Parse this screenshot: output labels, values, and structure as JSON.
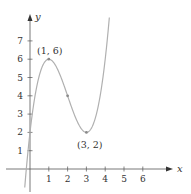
{
  "chart_data": {
    "type": "line",
    "title": "",
    "xlabel": "x",
    "ylabel": "y",
    "function": "y = x^3 - 6x^2 + 9x + 2",
    "xlim": [
      -0.8,
      7.5
    ],
    "ylim": [
      -1.3,
      8.3
    ],
    "grid": false,
    "x_ticks": [
      1,
      2,
      3,
      4,
      5,
      6
    ],
    "y_ticks": [
      1,
      2,
      3,
      4,
      5,
      6,
      7
    ],
    "curve_x_range": [
      -0.28,
      4.22
    ],
    "colors": {
      "curve": "#b0b0b0",
      "axis": "#555555",
      "text": "#333333",
      "point": "#8a8a8a"
    },
    "annotations": [
      {
        "label": "(1, 6)",
        "x": 1,
        "y": 6,
        "position": "above"
      },
      {
        "label": "(3, 2)",
        "x": 3,
        "y": 2,
        "position": "below"
      }
    ],
    "marked_points": [
      {
        "x": 1,
        "y": 6
      },
      {
        "x": 2,
        "y": 4
      },
      {
        "x": 3,
        "y": 2
      }
    ]
  },
  "labels": {
    "x_axis": "x",
    "y_axis": "y",
    "max_point": "(1, 6)",
    "min_point": "(3, 2)"
  }
}
